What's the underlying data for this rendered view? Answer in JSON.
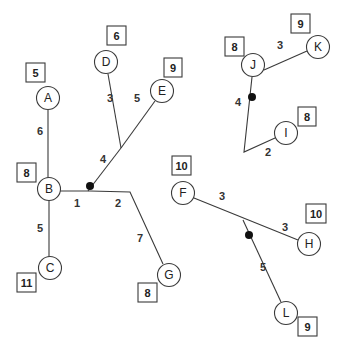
{
  "diagram": {
    "type": "weighted trees / Steiner tree graph",
    "nodes": [
      {
        "id": "A",
        "label": "A",
        "cx": 48,
        "cy": 98,
        "weight": "5",
        "box": {
          "x": 26,
          "y": 63,
          "w": 19,
          "h": 19
        }
      },
      {
        "id": "B",
        "label": "B",
        "cx": 49,
        "cy": 189,
        "weight": "8",
        "box": {
          "x": 17,
          "y": 163,
          "w": 19,
          "h": 19
        }
      },
      {
        "id": "C",
        "label": "C",
        "cx": 50,
        "cy": 268,
        "weight": "11",
        "box": {
          "x": 17,
          "y": 273,
          "w": 19,
          "h": 19
        }
      },
      {
        "id": "D",
        "label": "D",
        "cx": 106,
        "cy": 62,
        "weight": "6",
        "box": {
          "x": 107,
          "y": 26,
          "w": 19,
          "h": 19
        }
      },
      {
        "id": "E",
        "label": "E",
        "cx": 162,
        "cy": 91,
        "weight": "9",
        "box": {
          "x": 164,
          "y": 58,
          "w": 18,
          "h": 19
        }
      },
      {
        "id": "G",
        "label": "G",
        "cx": 169,
        "cy": 275,
        "weight": "8",
        "box": {
          "x": 138,
          "y": 283,
          "w": 19,
          "h": 19
        }
      },
      {
        "id": "F",
        "label": "F",
        "cx": 183,
        "cy": 193,
        "weight": "10",
        "box": {
          "x": 172,
          "y": 156,
          "w": 19,
          "h": 19
        }
      },
      {
        "id": "H",
        "label": "H",
        "cx": 309,
        "cy": 244,
        "weight": "10",
        "box": {
          "x": 306,
          "y": 204,
          "w": 20,
          "h": 19
        }
      },
      {
        "id": "L",
        "label": "L",
        "cx": 286,
        "cy": 313,
        "weight": "9",
        "box": {
          "x": 298,
          "y": 317,
          "w": 19,
          "h": 19
        }
      },
      {
        "id": "J",
        "label": "J",
        "cx": 253,
        "cy": 65,
        "weight": "8",
        "box": {
          "x": 225,
          "y": 37,
          "w": 19,
          "h": 19
        }
      },
      {
        "id": "K",
        "label": "K",
        "cx": 318,
        "cy": 47,
        "weight": "9",
        "box": {
          "x": 291,
          "y": 14,
          "w": 19,
          "h": 19
        }
      },
      {
        "id": "I",
        "label": "I",
        "cx": 286,
        "cy": 133,
        "weight": "8",
        "box": {
          "x": 298,
          "y": 107,
          "w": 18,
          "h": 19
        }
      }
    ],
    "edges": [
      {
        "points": [
          [
            48,
            110
          ],
          [
            48,
            178
          ]
        ],
        "weight": "6",
        "lx": 40,
        "ly": 131
      },
      {
        "points": [
          [
            49,
            200
          ],
          [
            49,
            257
          ]
        ],
        "weight": "5",
        "lx": 40,
        "ly": 228
      },
      {
        "points": [
          [
            60,
            191
          ],
          [
            90,
            191
          ]
        ],
        "weight": "1",
        "lx": 77,
        "ly": 203
      },
      {
        "points": [
          [
            90,
            191
          ],
          [
            130,
            192
          ],
          [
            163,
            264
          ]
        ],
        "weight": "2",
        "lx": 118,
        "ly": 203
      },
      {
        "points": [
          [
            130,
            192
          ],
          [
            163,
            264
          ]
        ],
        "weight": "7",
        "lx": 140,
        "ly": 238
      },
      {
        "points": [
          [
            90,
            191
          ],
          [
            121,
            148
          ]
        ],
        "weight": "4",
        "lx": 103,
        "ly": 159
      },
      {
        "points": [
          [
            121,
            148
          ],
          [
            108,
            74
          ]
        ],
        "weight": "3",
        "lx": 110,
        "ly": 98
      },
      {
        "points": [
          [
            121,
            148
          ],
          [
            155,
            101
          ]
        ],
        "weight": "5",
        "lx": 137,
        "ly": 98
      },
      {
        "points": [
          [
            264,
            60
          ],
          [
            307,
            50
          ]
        ],
        "weight": "3",
        "lx": 280,
        "ly": 45
      },
      {
        "points": [
          [
            252,
            77
          ],
          [
            244,
            152
          ]
        ],
        "weight": "4",
        "lx": 238,
        "ly": 102
      },
      {
        "points": [
          [
            244,
            152
          ],
          [
            275,
            138
          ]
        ],
        "weight": "2",
        "lx": 268,
        "ly": 152
      },
      {
        "points": [
          [
            194,
            198
          ],
          [
            243,
            221
          ]
        ],
        "weight": "3",
        "lx": 222,
        "ly": 196
      },
      {
        "points": [
          [
            243,
            221
          ],
          [
            298,
            240
          ]
        ],
        "weight": "3",
        "lx": 285,
        "ly": 227
      },
      {
        "points": [
          [
            243,
            221
          ],
          [
            280,
            302
          ]
        ],
        "weight": "5",
        "lx": 263,
        "ly": 267
      }
    ],
    "steiner_points": [
      {
        "cx": 90,
        "cy": 186
      },
      {
        "cx": 252,
        "cy": 97
      },
      {
        "cx": 249,
        "cy": 235
      }
    ]
  }
}
